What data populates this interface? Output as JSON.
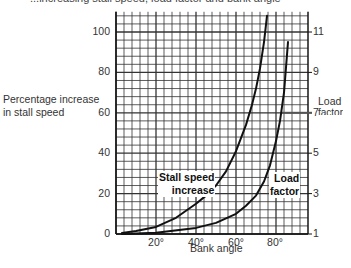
{
  "page": {
    "top_text_partial": "...increasing stall speed, load factor and bank angle"
  },
  "chart_data": {
    "type": "line",
    "title": "",
    "xlabel": "Bank angle",
    "ylabel": "Percentage increase in stall speed",
    "y2label": "Load factor",
    "xlim": [
      0,
      96
    ],
    "ylim": [
      0,
      110
    ],
    "y2lim": [
      1,
      12
    ],
    "x_ticks": [
      "20°",
      "40°",
      "60°",
      "80°"
    ],
    "x_tick_values": [
      20,
      40,
      60,
      80
    ],
    "y_ticks": [
      "0",
      "20",
      "40",
      "60",
      "80",
      "100"
    ],
    "y_tick_values": [
      0,
      20,
      40,
      60,
      80,
      100
    ],
    "y2_ticks": [
      "1",
      "3",
      "5",
      "7",
      "9",
      "11"
    ],
    "y2_tick_values": [
      1,
      3,
      5,
      7,
      9,
      11
    ],
    "grid": true,
    "grid_minor_step_x": 4,
    "grid_minor_step_y": 4,
    "reference_line": {
      "axis": "y2",
      "value": 7
    },
    "series": [
      {
        "name": "Stall speed increase",
        "axis": "left",
        "x": [
          3,
          10,
          20,
          30,
          40,
          45,
          50,
          55,
          60,
          65,
          68,
          70,
          72,
          74,
          75.5
        ],
        "y": [
          0.5,
          1.5,
          3.5,
          8,
          15,
          19,
          24,
          31,
          41,
          54,
          64,
          72,
          82,
          95,
          108
        ]
      },
      {
        "name": "Load factor",
        "axis": "right",
        "x": [
          3,
          20,
          40,
          50,
          60,
          65,
          70,
          74,
          77,
          80,
          82,
          84,
          86
        ],
        "y": [
          1.0,
          1.06,
          1.3,
          1.55,
          2.0,
          2.4,
          2.9,
          3.6,
          4.4,
          5.6,
          6.6,
          8.0,
          10.5
        ]
      }
    ],
    "annotations": [
      {
        "text": "Stall speed increase",
        "series": "Stall speed increase"
      },
      {
        "text": "Load factor",
        "series": "Load factor"
      }
    ]
  },
  "labels": {
    "ylabel_line1": "Percentage increase",
    "ylabel_line2": "in stall speed",
    "y2label_line1": "Load",
    "y2label_line2": "factor",
    "xlabel": "Bank angle",
    "stall_line1": "Stall speed",
    "stall_line2": "increase",
    "load_line1": "Load",
    "load_line2": "factor",
    "y_ticks": [
      "0",
      "20",
      "40",
      "60",
      "80",
      "100"
    ],
    "y2_ticks": [
      "1",
      "3",
      "5",
      "7",
      "9",
      "11"
    ],
    "x_ticks": [
      "20°",
      "40°",
      "60°",
      "80°"
    ]
  }
}
